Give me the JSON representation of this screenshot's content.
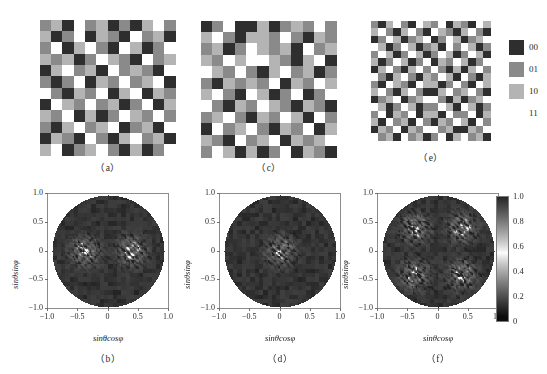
{
  "figure": {
    "header_note": "",
    "panels_top": [
      {
        "id": "a",
        "caption": "（a）",
        "cols": 12,
        "rows": 12,
        "seed": 17
      },
      {
        "id": "c",
        "caption": "（c）",
        "cols": 12,
        "rows": 12,
        "seed": 43
      },
      {
        "id": "e",
        "caption": "（e）",
        "cols": 16,
        "rows": 16,
        "seed": 91
      }
    ],
    "panels_bottom": [
      {
        "id": "b",
        "caption": "（b）",
        "mode": "two-lobe"
      },
      {
        "id": "d",
        "caption": "（d）",
        "mode": "center-lobe"
      },
      {
        "id": "f",
        "caption": "（f）",
        "mode": "four-lobe"
      }
    ]
  },
  "legend": {
    "name": "phase-level-legend",
    "items": [
      {
        "label": "00",
        "color": "#2e2e2e"
      },
      {
        "label": "01",
        "color": "#8a8a8a"
      },
      {
        "label": "10",
        "color": "#b4b4b4"
      },
      {
        "label": "11",
        "color": "#ffffff"
      }
    ]
  },
  "axes": {
    "xlabel_parts": {
      "sin": "sin",
      "theta": "θ",
      "trig": "cos",
      "phi": "φ"
    },
    "ylabel_parts": {
      "sin": "sin",
      "theta": "θ",
      "trig": "sin",
      "phi": "φ"
    },
    "xticks": [
      "−1.0",
      "−0.5",
      "0",
      "0.5",
      "1.0"
    ],
    "yticks": [
      "1.0",
      "0.5",
      "0",
      "−0.5",
      "−1.0"
    ],
    "xlim": [
      -1.0,
      1.0
    ],
    "ylim": [
      -1.0,
      1.0
    ]
  },
  "colorbar": {
    "name": "intensity-colorbar",
    "ticks": [
      "1.0",
      "0.8",
      "0.6",
      "0.4",
      "0.2",
      "0"
    ],
    "min": 0,
    "max": 1.0
  },
  "chart_data": {
    "type": "heatmap",
    "title": "",
    "xlabel": "sinθcosφ",
    "ylabel": "sinθsinφ",
    "xlim": [
      -1.0,
      1.0
    ],
    "ylim": [
      -1.0,
      1.0
    ],
    "grid": false,
    "legend_position": "right",
    "colormap_levels": [
      "00",
      "01",
      "10",
      "11"
    ],
    "colormap_values": [
      0,
      1,
      2,
      3
    ],
    "colorbar_range": [
      0,
      1.0
    ],
    "colorbar_ticks": [
      0,
      0.2,
      0.4,
      0.6,
      0.8,
      1.0
    ],
    "panels": [
      {
        "id": "a",
        "kind": "quaternary-phase-grid",
        "caption": "（a）",
        "cols": 12,
        "rows": 12,
        "levels": [
          0,
          1,
          2,
          3
        ],
        "cells": [
          [
            1,
            2,
            0,
            3,
            1,
            2,
            0,
            1,
            0,
            2,
            3,
            1
          ],
          [
            2,
            0,
            1,
            3,
            0,
            2,
            1,
            0,
            3,
            1,
            2,
            0
          ],
          [
            1,
            3,
            0,
            2,
            3,
            1,
            0,
            3,
            2,
            0,
            1,
            3
          ],
          [
            2,
            1,
            2,
            0,
            1,
            3,
            2,
            1,
            0,
            3,
            1,
            2
          ],
          [
            0,
            2,
            3,
            1,
            2,
            0,
            3,
            1,
            2,
            1,
            0,
            3
          ],
          [
            1,
            0,
            1,
            3,
            0,
            2,
            1,
            3,
            1,
            2,
            3,
            0
          ],
          [
            3,
            1,
            0,
            2,
            1,
            3,
            0,
            2,
            3,
            0,
            2,
            1
          ],
          [
            0,
            3,
            2,
            1,
            3,
            1,
            2,
            0,
            1,
            3,
            0,
            2
          ],
          [
            2,
            1,
            3,
            0,
            2,
            0,
            1,
            3,
            2,
            1,
            3,
            1
          ],
          [
            1,
            0,
            2,
            3,
            1,
            2,
            3,
            0,
            1,
            2,
            0,
            3
          ],
          [
            0,
            2,
            1,
            0,
            3,
            1,
            0,
            2,
            3,
            1,
            2,
            0
          ],
          [
            2,
            3,
            0,
            1,
            2,
            3,
            1,
            0,
            2,
            0,
            1,
            3
          ]
        ]
      },
      {
        "id": "c",
        "kind": "quaternary-phase-grid",
        "caption": "（c）",
        "cols": 12,
        "rows": 12,
        "levels": [
          0,
          1,
          2,
          3
        ],
        "cells": [
          [
            0,
            1,
            3,
            0,
            0,
            2,
            0,
            1,
            2,
            1,
            3,
            1
          ],
          [
            2,
            3,
            1,
            0,
            2,
            2,
            1,
            3,
            1,
            0,
            2,
            1
          ],
          [
            1,
            2,
            0,
            1,
            3,
            2,
            1,
            2,
            0,
            3,
            1,
            2
          ],
          [
            2,
            1,
            3,
            2,
            3,
            3,
            2,
            1,
            0,
            2,
            3,
            0
          ],
          [
            3,
            2,
            1,
            3,
            1,
            0,
            2,
            3,
            1,
            2,
            0,
            1
          ],
          [
            1,
            0,
            2,
            1,
            2,
            1,
            3,
            0,
            2,
            1,
            3,
            2
          ],
          [
            2,
            3,
            1,
            0,
            3,
            2,
            0,
            1,
            3,
            0,
            1,
            3
          ],
          [
            3,
            1,
            0,
            2,
            1,
            3,
            2,
            1,
            0,
            2,
            1,
            0
          ],
          [
            1,
            2,
            3,
            1,
            0,
            2,
            1,
            3,
            2,
            0,
            3,
            1
          ],
          [
            0,
            3,
            1,
            2,
            3,
            1,
            0,
            2,
            1,
            3,
            0,
            2
          ],
          [
            2,
            1,
            0,
            3,
            1,
            2,
            3,
            0,
            2,
            1,
            2,
            3
          ],
          [
            1,
            3,
            2,
            0,
            2,
            0,
            1,
            3,
            0,
            2,
            1,
            0
          ]
        ]
      },
      {
        "id": "e",
        "kind": "quaternary-phase-grid",
        "caption": "（e）",
        "cols": 16,
        "rows": 16,
        "levels": [
          0,
          1,
          2,
          3
        ],
        "cells": [
          [
            1,
            0,
            2,
            3,
            1,
            0,
            3,
            2,
            1,
            3,
            0,
            2,
            1,
            0,
            3,
            2
          ],
          [
            2,
            3,
            1,
            0,
            2,
            3,
            1,
            0,
            3,
            2,
            1,
            0,
            2,
            3,
            1,
            0
          ],
          [
            0,
            1,
            3,
            2,
            0,
            1,
            2,
            3,
            0,
            1,
            3,
            2,
            0,
            1,
            2,
            3
          ],
          [
            3,
            2,
            0,
            1,
            3,
            2,
            0,
            1,
            2,
            0,
            3,
            1,
            3,
            2,
            0,
            1
          ],
          [
            1,
            3,
            2,
            0,
            1,
            3,
            2,
            0,
            1,
            3,
            2,
            0,
            1,
            3,
            2,
            0
          ],
          [
            2,
            0,
            1,
            3,
            2,
            0,
            1,
            3,
            0,
            2,
            1,
            3,
            2,
            0,
            1,
            3
          ],
          [
            0,
            2,
            3,
            1,
            0,
            2,
            3,
            1,
            3,
            1,
            0,
            2,
            0,
            2,
            3,
            1
          ],
          [
            3,
            1,
            0,
            2,
            3,
            1,
            0,
            2,
            1,
            3,
            2,
            0,
            3,
            1,
            0,
            2
          ],
          [
            1,
            0,
            3,
            2,
            1,
            0,
            3,
            2,
            2,
            0,
            1,
            3,
            1,
            0,
            3,
            2
          ],
          [
            2,
            3,
            1,
            0,
            2,
            3,
            1,
            0,
            0,
            2,
            3,
            1,
            2,
            3,
            1,
            0
          ],
          [
            0,
            1,
            2,
            3,
            0,
            1,
            2,
            3,
            3,
            1,
            0,
            2,
            0,
            1,
            2,
            3
          ],
          [
            3,
            2,
            0,
            1,
            3,
            2,
            0,
            1,
            1,
            3,
            2,
            0,
            3,
            2,
            0,
            1
          ],
          [
            1,
            3,
            0,
            2,
            1,
            3,
            0,
            2,
            2,
            0,
            3,
            1,
            1,
            3,
            0,
            2
          ],
          [
            2,
            0,
            3,
            1,
            2,
            0,
            3,
            1,
            0,
            2,
            1,
            3,
            2,
            0,
            3,
            1
          ],
          [
            0,
            2,
            1,
            3,
            0,
            2,
            1,
            3,
            3,
            1,
            2,
            0,
            0,
            2,
            1,
            3
          ],
          [
            3,
            1,
            2,
            0,
            3,
            1,
            2,
            0,
            1,
            3,
            0,
            2,
            3,
            1,
            2,
            0
          ]
        ]
      },
      {
        "id": "b",
        "kind": "far-field-diffraction",
        "caption": "（b）",
        "lobes": 2,
        "lobe_centers": [
          [
            -0.42,
            0.0
          ],
          [
            0.42,
            0.0
          ]
        ],
        "peak_intensity": 1.0,
        "background_intensity": 0.05
      },
      {
        "id": "d",
        "kind": "far-field-diffraction",
        "caption": "（d）",
        "lobes": 1,
        "lobe_centers": [
          [
            0.0,
            0.0
          ]
        ],
        "peak_intensity": 1.0,
        "background_intensity": 0.05
      },
      {
        "id": "f",
        "kind": "far-field-diffraction",
        "caption": "（f）",
        "lobes": 4,
        "lobe_centers": [
          [
            -0.42,
            0.42
          ],
          [
            0.42,
            0.42
          ],
          [
            -0.42,
            -0.42
          ],
          [
            0.42,
            -0.42
          ]
        ],
        "peak_intensity": 1.0,
        "background_intensity": 0.05
      }
    ]
  }
}
